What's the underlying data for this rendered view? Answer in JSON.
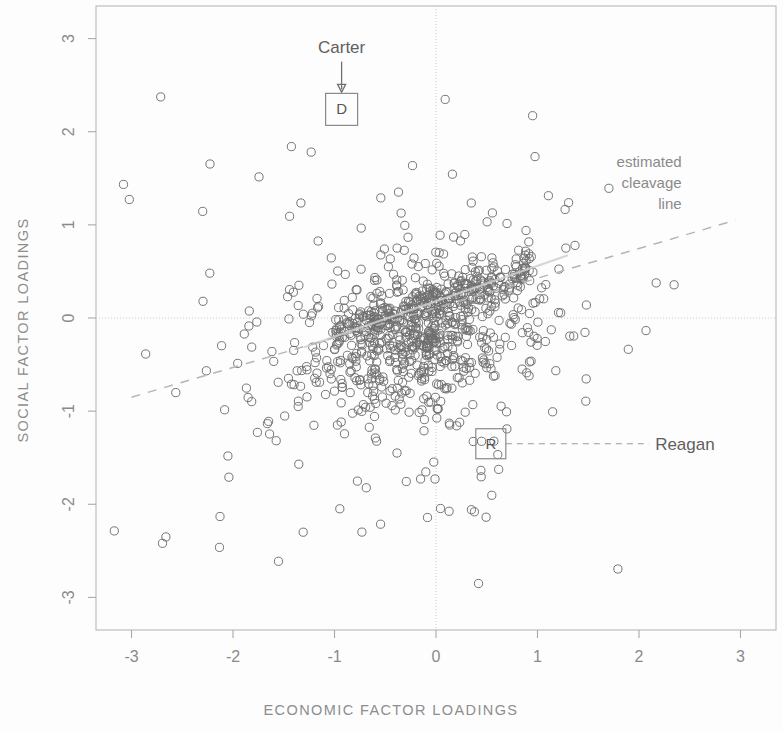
{
  "figure": {
    "width": 783,
    "height": 733,
    "background": "#fdfdfd",
    "ink_color": "#6e6e6e"
  },
  "chart_data": {
    "type": "scatter",
    "title": "",
    "subtitle": "",
    "xlabel": "ECONOMIC FACTOR LOADINGS",
    "ylabel": "SOCIAL FACTOR LOADINGS",
    "xlim": [
      -3.35,
      3.35
    ],
    "ylim": [
      -3.35,
      3.35
    ],
    "xticks": [
      -3,
      -2,
      -1,
      0,
      1,
      2,
      3
    ],
    "xticklabels": [
      "-3",
      "-2",
      "-1",
      "0",
      "1",
      "2",
      "3"
    ],
    "yticks": [
      -3,
      -2,
      -1,
      0,
      1,
      2,
      3
    ],
    "yticklabels": [
      "-3",
      "-2",
      "-1",
      "0",
      "1",
      "2",
      "3"
    ],
    "grid": false,
    "reference_lines": [
      {
        "name": "x-zero-line",
        "orientation": "vertical",
        "value": 0,
        "style": "dotted"
      },
      {
        "name": "y-zero-line",
        "orientation": "horizontal",
        "value": 0,
        "style": "dotted"
      }
    ],
    "marker": {
      "shape": "open-circle",
      "radius_px": 4.1,
      "fill": "none",
      "edge": "#6e6e6e"
    },
    "legend": {
      "visible": false,
      "position": "none"
    },
    "series": [
      {
        "name": "respondents",
        "marker": "open-circle",
        "n_points": 960,
        "description": "Dense elliptical cloud of survey respondents centered slightly left of and below the origin, with a tight high-density ridge running from about (-1.0, -0.2) up to (0.9, 0.6)."
      }
    ],
    "cluster_model": {
      "core": {
        "n": 520,
        "mean_x": -0.15,
        "mean_y": -0.2,
        "sd_x": 0.55,
        "sd_y": 0.4,
        "corr": 0.45
      },
      "ridge": {
        "n": 200,
        "x_from": -1.05,
        "x_to": 0.95,
        "slope": 0.38,
        "intercept": 0.18,
        "sd": 0.1
      },
      "halo": {
        "n": 190,
        "mean_x": -0.25,
        "mean_y": -0.25,
        "sd_x": 1.05,
        "sd_y": 0.95,
        "corr": 0.18
      },
      "outer": {
        "n": 50,
        "mean_x": -0.35,
        "mean_y": -0.2,
        "sd_x": 1.55,
        "sd_y": 1.45,
        "corr": 0.1
      }
    },
    "annotations": [
      {
        "name": "carter-annotation",
        "label": "Carter",
        "marker_letter": "D",
        "marker_x": -0.93,
        "marker_y": 2.24,
        "label_x": -0.93,
        "label_y": 2.85,
        "connector": "down-arrow"
      },
      {
        "name": "reagan-annotation",
        "label": "Reagan",
        "marker_letter": "R",
        "marker_x": 0.55,
        "marker_y": -1.35,
        "label_x": 2.1,
        "label_y": -1.35,
        "connector": "dashed-leader-left"
      },
      {
        "name": "cleavage-line-annotation",
        "label_lines": [
          "estimated",
          "cleavage",
          "line"
        ],
        "label_x": 2.42,
        "label_y": 1.62,
        "line_from": [
          -3.0,
          -0.85
        ],
        "line_to": [
          2.95,
          1.05
        ],
        "style": "dashed"
      }
    ]
  }
}
